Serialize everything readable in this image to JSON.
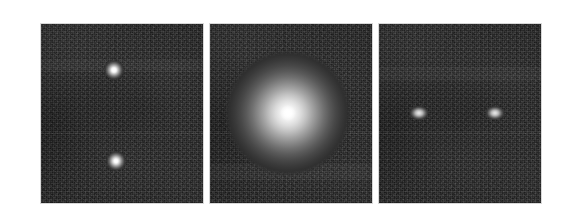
{
  "figure": {
    "background_color": "#ffffff",
    "width": 561,
    "height": 223,
    "panel_border_color": "#d8d8d8",
    "panel_background_color": "#232323",
    "layout": {
      "left": 40,
      "top": 23,
      "panel_width": 164,
      "panel_height": 181,
      "gap": 5
    }
  },
  "panels": [
    {
      "id": "panel-left",
      "label": "Panel 1",
      "description": "Two compact unresolved point sources separated vertically",
      "source_count": 2,
      "sources": [
        {
          "name": "source-a",
          "kind": "point",
          "cx_pct": 45.0,
          "cy_pct": 25.5,
          "size_px": 22,
          "peak_brightness": "#ffffff",
          "core_px": 7
        },
        {
          "name": "source-b",
          "kind": "point",
          "cx_pct": 46.0,
          "cy_pct": 76.5,
          "size_px": 22,
          "peak_brightness": "#ffffff",
          "core_px": 6
        }
      ],
      "seam_y_pct": 61.0,
      "band_y_pct": 20.0,
      "band_h_pct": 7.0
    },
    {
      "id": "panel-center",
      "label": "Panel 2",
      "description": "Single bright extended diffuse source filling the central region",
      "source_count": 1,
      "sources": [
        {
          "name": "source-extended",
          "kind": "extended",
          "cx_pct": 48.0,
          "cy_pct": 49.5,
          "size_px": 128,
          "peak_brightness": "#ffffff",
          "core_px": 16
        }
      ],
      "seam_y_pct": 61.0,
      "band_y_pct": 78.0,
      "band_h_pct": 9.0
    },
    {
      "id": "panel-right",
      "label": "Panel 3",
      "description": "Two slightly elongated sources aligned horizontally, separated in the east-west direction",
      "source_count": 2,
      "sources": [
        {
          "name": "source-c",
          "kind": "elongated",
          "cx_pct": 24.5,
          "cy_pct": 49.5,
          "size_px": 20,
          "height_px": 15,
          "peak_brightness": "#e8e8e8",
          "core_px": 0
        },
        {
          "name": "source-d",
          "kind": "elongated",
          "cx_pct": 71.5,
          "cy_pct": 49.5,
          "size_px": 20,
          "height_px": 15,
          "peak_brightness": "#e8e8e8",
          "core_px": 0
        }
      ],
      "seam_y_pct": 61.0,
      "band_y_pct": 24.0,
      "band_h_pct": 8.0
    }
  ]
}
